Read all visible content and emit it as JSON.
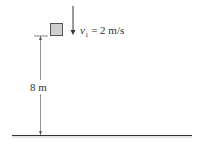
{
  "figure": {
    "velocity_label": {
      "symbol": "v",
      "subscript": "1",
      "equals": " = 2 m/s"
    },
    "height_label": "8 m",
    "colors": {
      "block_fill": "#cfcfcf",
      "block_stroke": "#555555",
      "line": "#444444",
      "ground": "#333333"
    }
  }
}
